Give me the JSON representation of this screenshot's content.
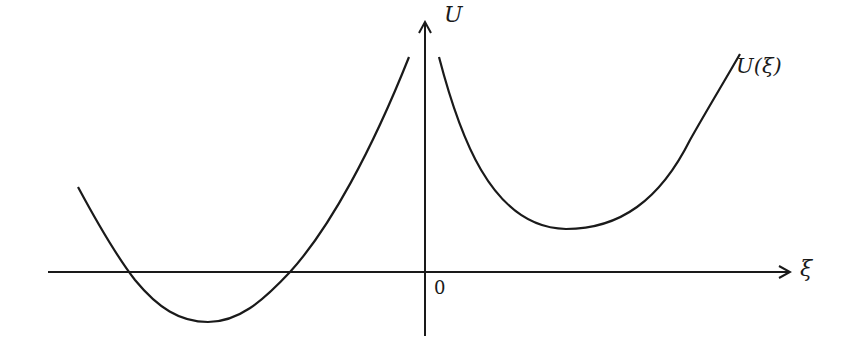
{
  "diagram": {
    "type": "potential-energy-curve",
    "axes": {
      "y_label": "U",
      "x_label": "ξ",
      "origin_label": "0"
    },
    "curve_label": "U(ξ)",
    "colors": {
      "stroke": "#1a1a1a",
      "background": "#ffffff"
    },
    "curves": [
      {
        "name": "left-branch",
        "description": "well for ξ < 0 with minimum below the ξ-axis, rising steeply toward ξ = 0"
      },
      {
        "name": "right-branch",
        "description": "well for ξ > 0 with minimum above the ξ-axis, rising steeply toward ξ = 0 and increasing for large ξ"
      }
    ]
  }
}
